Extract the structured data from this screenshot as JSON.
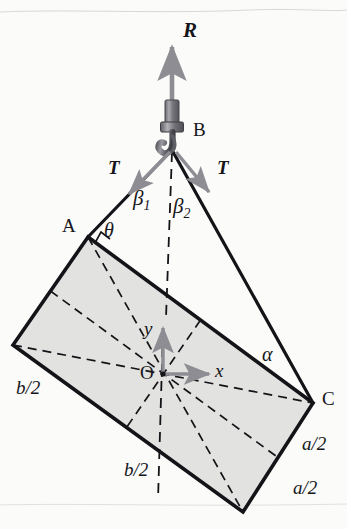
{
  "figure": {
    "background_color": "#fbfbfa",
    "plate_fill": "#e2e2e0",
    "line_color": "#141418",
    "arrow_color": "#8d8d93",
    "hook_color": "#77777d"
  },
  "labels": {
    "resultant": "R",
    "hook_point": "B",
    "tension_left": "T",
    "tension_right": "T",
    "beta1": "β",
    "beta1_sub": "1",
    "beta2": "β",
    "beta2_sub": "2",
    "corner_a": "A",
    "corner_c": "C",
    "theta": "θ",
    "alpha": "α",
    "origin": "O",
    "axis_x": "x",
    "axis_y": "y",
    "b_half_left": "b/2",
    "b_half_bottom": "b/2",
    "a_half_upper": "a/2",
    "a_half_lower": "a/2"
  },
  "geometry": {
    "hook_tip": [
      172,
      148
    ],
    "resultant_tip": [
      172,
      45
    ],
    "corner_a": [
      88,
      237
    ],
    "corner_left": [
      13,
      345
    ],
    "corner_bottom": [
      243,
      512
    ],
    "corner_c": [
      313,
      403
    ],
    "origin": [
      163,
      374
    ],
    "x_axis_tip": [
      212,
      374
    ],
    "y_axis_tip": [
      163,
      325
    ]
  },
  "icons": {
    "resultant_arrow": "up-arrow-icon",
    "tension_arrow_left": "down-left-arrow-icon",
    "tension_arrow_right": "down-right-arrow-icon",
    "hook": "crane-hook-icon",
    "x_axis_arrow": "right-arrow-icon",
    "y_axis_arrow": "up-arrow-icon"
  }
}
